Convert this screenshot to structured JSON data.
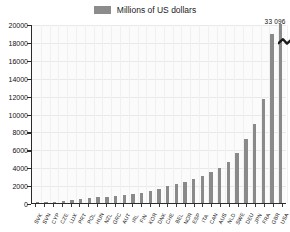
{
  "legend": {
    "swatch_color": "#8c8c8c",
    "label": "Millions of US dollars"
  },
  "annotation": {
    "text": "33 096"
  },
  "chart_data": {
    "type": "bar",
    "title": "",
    "subtitle": "",
    "xlabel": "",
    "ylabel": "",
    "ylim": [
      0,
      20000
    ],
    "yticks": [
      0,
      2000,
      4000,
      6000,
      8000,
      10000,
      12000,
      14000,
      16000,
      18000,
      20000
    ],
    "ytick_labels": [
      "0",
      "2000",
      "4000",
      "6000",
      "8000",
      "10000",
      "12000",
      "14000",
      "16000",
      "18000",
      "20000"
    ],
    "grid": true,
    "legend_position": "top-center",
    "series_name": "Millions of US dollars",
    "bar_color": "#8a8a8a",
    "truncated_bars": [
      {
        "category": "USA",
        "actual_value": 33096,
        "displayed_label": "33 096"
      }
    ],
    "categories": [
      "SVK",
      "SVN",
      "CYP",
      "CZE",
      "LUX",
      "PRT",
      "POL",
      "HUN",
      "NZL",
      "GRC",
      "AUT",
      "IRL",
      "FIN",
      "KOR",
      "DNK",
      "CHE",
      "BEL",
      "NOR",
      "ESP",
      "ITA",
      "CAN",
      "AUS",
      "NLD",
      "SWE",
      "DEU",
      "JPN",
      "FRA",
      "GBR",
      "USA"
    ],
    "values": [
      60,
      90,
      130,
      200,
      290,
      400,
      510,
      620,
      700,
      790,
      900,
      1010,
      1120,
      1380,
      1620,
      1880,
      2140,
      2380,
      2700,
      3050,
      3450,
      3950,
      4600,
      5600,
      7200,
      8800,
      11600,
      18900,
      33096
    ]
  }
}
